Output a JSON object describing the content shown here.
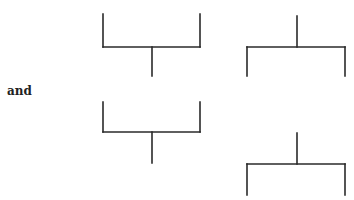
{
  "text": {
    "connector": "and"
  },
  "colors": {
    "stroke": "#2a2a2a",
    "background": "#ffffff",
    "text": "#222222"
  },
  "shapes": [
    {
      "name": "top-left-bracket",
      "orientation": "stem-down",
      "arms_x": [
        103,
        200
      ],
      "arms_top_y": 14,
      "bar_y": 47,
      "stem_x": 152,
      "stem_end_y": 76
    },
    {
      "name": "top-right-bracket",
      "orientation": "stem-up",
      "arms_x": [
        247,
        345
      ],
      "stem_x": 297,
      "stem_top_y": 16,
      "bar_y": 47,
      "arms_end_y": 76
    },
    {
      "name": "bottom-left-bracket",
      "orientation": "stem-down",
      "arms_x": [
        103,
        200
      ],
      "arms_top_y": 102,
      "bar_y": 132,
      "stem_x": 152,
      "stem_end_y": 163
    },
    {
      "name": "bottom-right-bracket",
      "orientation": "stem-up",
      "arms_x": [
        247,
        345
      ],
      "stem_x": 297,
      "stem_top_y": 133,
      "bar_y": 164,
      "arms_end_y": 195
    }
  ]
}
